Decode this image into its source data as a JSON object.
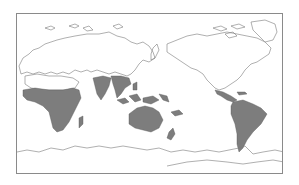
{
  "map": {
    "projection": "world, Pacific-centered",
    "colors": {
      "background": "#ffffff",
      "outline": "#7a7a7a",
      "highlight": "#7d7d7d",
      "frame": "#8a8a8a"
    },
    "highlighted_regions": [
      "Sub-Saharan Africa",
      "Madagascar",
      "India",
      "Southeast Asia",
      "Indonesia",
      "New Guinea",
      "Australia",
      "Melanesian Pacific islands",
      "New Zealand",
      "Central America",
      "Caribbean",
      "South America"
    ],
    "unhighlighted_regions": [
      "Europe",
      "Northern Asia",
      "North America",
      "Greenland",
      "Antarctica"
    ]
  }
}
